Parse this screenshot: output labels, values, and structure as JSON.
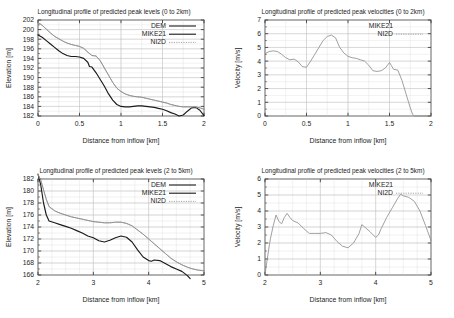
{
  "figure": {
    "panel_count": 4,
    "axis_label_x": "Distance from inflow [km]",
    "axis_label_y_elevation": "Elevation [m]",
    "axis_label_y_velocity": "Velocity [m/s]"
  },
  "chart_data": [
    {
      "id": "peak-levels-0-2km",
      "type": "line",
      "title": "Longitudinal profile of predicted peak levels (0 to 2km)",
      "xlabel": "Distance from inflow [km]",
      "ylabel": "Elevation [m]",
      "xlim": [
        0,
        2
      ],
      "ylim": [
        182,
        202
      ],
      "xticks": [
        0,
        0.5,
        1,
        1.5,
        2
      ],
      "xtick_labels": [
        "0",
        "0.5",
        "1",
        "1.5",
        "2"
      ],
      "yticks": [
        182,
        184,
        186,
        188,
        190,
        192,
        194,
        196,
        198,
        200,
        202
      ],
      "ytick_labels": [
        "182",
        "184",
        "186",
        "188",
        "190",
        "192",
        "194",
        "196",
        "198",
        "200",
        "202"
      ],
      "grid": true,
      "legend_position": "top-right",
      "legend": [
        {
          "name": "DEM",
          "style": "solid",
          "color": "#1a1a1a"
        },
        {
          "name": "MIKE21",
          "style": "solid",
          "color": "#8c8c8c"
        },
        {
          "name": "NI2D",
          "style": "dotted",
          "color": "#8c8c8c"
        }
      ],
      "series": [
        {
          "name": "DEM",
          "x": [
            0,
            0.05,
            0.1,
            0.15,
            0.2,
            0.25,
            0.3,
            0.35,
            0.4,
            0.45,
            0.5,
            0.55,
            0.6,
            0.62,
            0.65,
            0.7,
            0.75,
            0.8,
            0.85,
            0.9,
            0.95,
            1.0,
            1.05,
            1.1,
            1.15,
            1.2,
            1.25,
            1.3,
            1.35,
            1.4,
            1.45,
            1.5,
            1.55,
            1.6,
            1.65,
            1.7,
            1.75,
            1.8,
            1.85,
            1.9,
            1.95,
            2.0
          ],
          "y": [
            198.9,
            198.4,
            197.7,
            197.0,
            196.3,
            195.6,
            195.0,
            194.6,
            194.4,
            194.4,
            194.3,
            194.0,
            193.2,
            192.3,
            192.2,
            191.0,
            189.6,
            188.2,
            186.6,
            185.3,
            184.4,
            184.0,
            183.9,
            183.9,
            184.0,
            184.1,
            184.1,
            184.0,
            183.9,
            183.8,
            183.6,
            183.4,
            183.1,
            182.7,
            182.4,
            182.0,
            182.2,
            183.0,
            183.7,
            183.8,
            183.2,
            182.1
          ]
        },
        {
          "name": "MIKE21",
          "x": [
            0,
            0.05,
            0.1,
            0.15,
            0.2,
            0.25,
            0.3,
            0.35,
            0.4,
            0.45,
            0.5,
            0.55,
            0.6,
            0.65,
            0.7,
            0.75,
            0.8,
            0.85,
            0.9,
            0.95,
            1.0,
            1.05,
            1.1,
            1.15,
            1.2,
            1.25,
            1.3,
            1.35,
            1.4,
            1.45,
            1.5,
            1.55,
            1.6,
            1.65,
            1.7,
            1.75,
            1.8,
            1.85,
            1.9,
            1.95,
            2.0
          ],
          "y": [
            201.5,
            200.9,
            200.1,
            199.3,
            198.6,
            198.1,
            197.6,
            197.2,
            196.9,
            196.7,
            196.5,
            196.1,
            195.3,
            194.6,
            194.5,
            193.5,
            192.0,
            190.5,
            189.0,
            187.8,
            187.1,
            186.6,
            186.3,
            186.1,
            186.0,
            185.9,
            185.7,
            185.5,
            185.3,
            185.1,
            184.9,
            184.7,
            184.4,
            184.2,
            184.0,
            183.9,
            183.9,
            183.9,
            183.9,
            183.7,
            183.4
          ]
        },
        {
          "name": "NI2D",
          "x": [
            0,
            0.05,
            0.1,
            0.15,
            0.2,
            0.25,
            0.3,
            0.35,
            0.4,
            0.45,
            0.5,
            0.55,
            0.6,
            0.65,
            0.7,
            0.75,
            0.8,
            0.85,
            0.9,
            0.95,
            1.0,
            1.05,
            1.1,
            1.15,
            1.2,
            1.25,
            1.3,
            1.35,
            1.4,
            1.45,
            1.5,
            1.55,
            1.6,
            1.65,
            1.7,
            1.75,
            1.8,
            1.85,
            1.9,
            1.95,
            2.0
          ],
          "y": [
            201.5,
            200.9,
            200.1,
            199.3,
            198.6,
            198.1,
            197.6,
            197.2,
            196.9,
            196.7,
            196.5,
            196.1,
            195.3,
            194.6,
            194.5,
            193.5,
            192.0,
            190.5,
            189.0,
            187.8,
            187.1,
            186.6,
            186.3,
            186.1,
            186.0,
            185.9,
            185.7,
            185.5,
            185.3,
            185.1,
            184.9,
            184.7,
            184.4,
            184.2,
            184.0,
            183.9,
            183.9,
            183.9,
            183.9,
            183.7,
            183.4
          ]
        }
      ]
    },
    {
      "id": "peak-velocities-0-2km",
      "type": "line",
      "title": "Longitudinal profile of predicted peak velocities (0 to 2km)",
      "xlabel": "Distance from inflow [km]",
      "ylabel": "Velocity [m/s]",
      "xlim": [
        0,
        2
      ],
      "ylim": [
        0,
        7
      ],
      "xticks": [
        0,
        0.5,
        1,
        1.5,
        2
      ],
      "xtick_labels": [
        "0",
        "0.5",
        "1",
        "1.5",
        "2"
      ],
      "yticks": [
        0,
        1,
        2,
        3,
        4,
        5,
        6,
        7
      ],
      "ytick_labels": [
        "0",
        "1",
        "2",
        "3",
        "4",
        "5",
        "6",
        "7"
      ],
      "grid": true,
      "legend_position": "top-right",
      "legend": [
        {
          "name": "MIKE21",
          "style": "none",
          "color": "#8c8c8c"
        },
        {
          "name": "NI2D",
          "style": "dotted",
          "color": "#8c8c8c"
        }
      ],
      "series": [
        {
          "name": "NI2D",
          "x": [
            0,
            0.05,
            0.1,
            0.15,
            0.2,
            0.25,
            0.3,
            0.35,
            0.4,
            0.45,
            0.5,
            0.55,
            0.6,
            0.65,
            0.7,
            0.75,
            0.8,
            0.85,
            0.9,
            0.95,
            1.0,
            1.05,
            1.1,
            1.15,
            1.2,
            1.25,
            1.3,
            1.35,
            1.4,
            1.45,
            1.5,
            1.52,
            1.55,
            1.6,
            1.65,
            1.7,
            1.75,
            1.78,
            1.8,
            1.9,
            2.0
          ],
          "y": [
            4.55,
            4.7,
            4.75,
            4.7,
            4.5,
            4.25,
            4.1,
            4.15,
            3.95,
            3.6,
            3.55,
            4.0,
            4.5,
            5.0,
            5.5,
            5.8,
            5.9,
            5.7,
            5.0,
            4.6,
            4.35,
            4.25,
            4.2,
            4.1,
            4.0,
            3.7,
            3.3,
            3.25,
            3.3,
            3.5,
            3.9,
            3.7,
            3.4,
            3.35,
            2.6,
            1.6,
            0.6,
            0.1,
            0.0,
            0.0,
            0.0
          ]
        }
      ]
    },
    {
      "id": "peak-levels-2-5km",
      "type": "line",
      "title": "Longitudinal profile of predicted peak levels (2 to 5km)",
      "xlabel": "Distance from inflow [km]",
      "ylabel": "Elevation [m]",
      "xlim": [
        2,
        5
      ],
      "ylim": [
        166,
        182
      ],
      "xticks": [
        2,
        3,
        4,
        5
      ],
      "xtick_labels": [
        "2",
        "3",
        "4",
        "5"
      ],
      "yticks": [
        166,
        168,
        170,
        172,
        174,
        176,
        178,
        180,
        182
      ],
      "ytick_labels": [
        "166",
        "168",
        "170",
        "172",
        "174",
        "176",
        "178",
        "180",
        "182"
      ],
      "grid": true,
      "legend_position": "top-right",
      "legend": [
        {
          "name": "DEM",
          "style": "solid",
          "color": "#1a1a1a"
        },
        {
          "name": "MIKE21",
          "style": "solid",
          "color": "#8c8c8c"
        },
        {
          "name": "NI2D",
          "style": "dotted",
          "color": "#8c8c8c"
        }
      ],
      "series": [
        {
          "name": "DEM",
          "x": [
            2.0,
            2.05,
            2.1,
            2.15,
            2.2,
            2.3,
            2.4,
            2.5,
            2.6,
            2.7,
            2.8,
            2.9,
            3.0,
            3.1,
            3.2,
            3.3,
            3.4,
            3.5,
            3.6,
            3.7,
            3.8,
            3.9,
            4.0,
            4.05,
            4.1,
            4.2,
            4.3,
            4.4,
            4.5,
            4.6,
            4.7,
            4.75
          ],
          "y": [
            182.8,
            181.0,
            178.0,
            176.0,
            175.0,
            174.7,
            174.4,
            174.1,
            173.8,
            173.4,
            173.0,
            172.5,
            172.2,
            171.7,
            171.5,
            171.8,
            172.2,
            172.5,
            172.3,
            171.5,
            170.2,
            169.0,
            168.4,
            168.3,
            168.5,
            168.4,
            167.9,
            167.4,
            167.0,
            166.6,
            165.9,
            165.4
          ]
        },
        {
          "name": "MIKE21",
          "x": [
            2.0,
            2.05,
            2.1,
            2.15,
            2.2,
            2.3,
            2.4,
            2.5,
            2.6,
            2.7,
            2.8,
            2.9,
            3.0,
            3.1,
            3.2,
            3.3,
            3.4,
            3.5,
            3.6,
            3.7,
            3.8,
            3.9,
            4.0,
            4.1,
            4.2,
            4.3,
            4.4,
            4.5,
            4.6,
            4.7,
            4.8,
            4.9,
            5.0
          ],
          "y": [
            182.8,
            181.8,
            180.2,
            178.6,
            177.4,
            176.7,
            176.3,
            176.0,
            175.7,
            175.5,
            175.3,
            175.1,
            174.9,
            174.8,
            174.7,
            174.7,
            174.8,
            174.8,
            174.6,
            174.2,
            173.5,
            172.8,
            172.0,
            171.2,
            170.4,
            169.6,
            168.8,
            168.2,
            167.7,
            167.3,
            167.0,
            166.8,
            166.7
          ]
        },
        {
          "name": "NI2D",
          "x": [
            2.0,
            2.05,
            2.1,
            2.15,
            2.2,
            2.3,
            2.4,
            2.5,
            2.6,
            2.7,
            2.8,
            2.9,
            3.0,
            3.1,
            3.2,
            3.3,
            3.4,
            3.5,
            3.6,
            3.7,
            3.8,
            3.9,
            4.0,
            4.1,
            4.2,
            4.3,
            4.4,
            4.5,
            4.6,
            4.7,
            4.8,
            4.9,
            5.0
          ],
          "y": [
            182.8,
            181.8,
            180.2,
            178.6,
            177.4,
            176.7,
            176.3,
            176.0,
            175.7,
            175.5,
            175.3,
            175.1,
            174.9,
            174.8,
            174.7,
            174.7,
            174.8,
            174.8,
            174.6,
            174.2,
            173.5,
            172.8,
            172.0,
            171.2,
            170.4,
            169.6,
            168.8,
            168.2,
            167.7,
            167.3,
            167.0,
            166.8,
            166.7
          ]
        }
      ]
    },
    {
      "id": "peak-velocities-2-5km",
      "type": "line",
      "title": "Longitudinal profile of predicted peak velocities (2 to 5km)",
      "xlabel": "Distance from inflow [km]",
      "ylabel": "Velocity [m/s]",
      "xlim": [
        2,
        5
      ],
      "ylim": [
        0,
        6
      ],
      "xticks": [
        2,
        3,
        4,
        5
      ],
      "xtick_labels": [
        "2",
        "3",
        "4",
        "5"
      ],
      "yticks": [
        0,
        1,
        2,
        3,
        4,
        5,
        6
      ],
      "ytick_labels": [
        "0",
        "1",
        "2",
        "3",
        "4",
        "5",
        "6"
      ],
      "grid": true,
      "legend_position": "top-right",
      "legend": [
        {
          "name": "MIKE21",
          "style": "none",
          "color": "#8c8c8c"
        },
        {
          "name": "NI2D",
          "style": "dotted",
          "color": "#8c8c8c"
        }
      ],
      "series": [
        {
          "name": "NI2D",
          "x": [
            2.0,
            2.02,
            2.05,
            2.08,
            2.1,
            2.15,
            2.2,
            2.25,
            2.3,
            2.35,
            2.4,
            2.45,
            2.5,
            2.6,
            2.7,
            2.8,
            2.9,
            3.0,
            3.1,
            3.2,
            3.3,
            3.4,
            3.5,
            3.6,
            3.7,
            3.75,
            3.8,
            3.9,
            4.0,
            4.05,
            4.1,
            4.2,
            4.3,
            4.4,
            4.45,
            4.5,
            4.6,
            4.7,
            4.8,
            4.9,
            5.0
          ],
          "y": [
            0.0,
            0.5,
            1.2,
            1.9,
            2.3,
            3.1,
            3.75,
            3.35,
            3.2,
            3.6,
            3.85,
            3.6,
            3.4,
            3.25,
            2.9,
            2.6,
            2.6,
            2.6,
            2.65,
            2.5,
            2.1,
            1.8,
            1.7,
            2.0,
            2.6,
            3.15,
            3.0,
            2.7,
            2.35,
            2.5,
            2.9,
            3.6,
            4.2,
            4.8,
            5.05,
            4.95,
            4.85,
            4.6,
            4.0,
            3.1,
            2.15
          ]
        }
      ]
    }
  ]
}
